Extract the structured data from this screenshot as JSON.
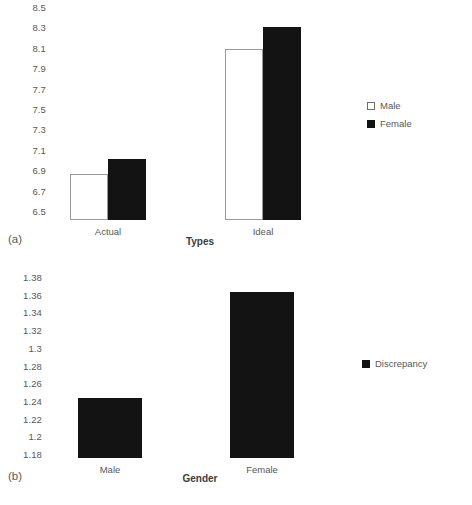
{
  "figure": {
    "background": "#ffffff",
    "text_color": "#58585a",
    "bar_fill_color": "#131313",
    "bar_open_color": "#ffffff",
    "bar_border_color": "#9a9a9c"
  },
  "panel_a": {
    "tag": "(a)",
    "xlabel": "Types",
    "legend": [
      {
        "label": "Male",
        "swatch": "open-square-icon"
      },
      {
        "label": "Female",
        "swatch": "filled-square-icon"
      }
    ],
    "yticks": [
      "8.5",
      "8.3",
      "8.1",
      "7.9",
      "7.7",
      "7.5",
      "7.3",
      "7.1",
      "6.9",
      "6.7",
      "6.5"
    ],
    "categories": [
      "Actual",
      "Ideal"
    ]
  },
  "panel_b": {
    "tag": "(b)",
    "xlabel": "Gender",
    "legend": [
      {
        "label": "Discrepancy",
        "swatch": "filled-square-icon"
      }
    ],
    "yticks": [
      "1.38",
      "1.36",
      "1.34",
      "1.32",
      "1.3",
      "1.28",
      "1.26",
      "1.24",
      "1.22",
      "1.2",
      "1.18"
    ],
    "categories": [
      "Male",
      "Female"
    ]
  },
  "chart_data": [
    {
      "type": "bar",
      "panel": "(a)",
      "title": "",
      "xlabel": "Types",
      "ylabel": "",
      "ylim": [
        6.5,
        8.5
      ],
      "ytick_step": 0.2,
      "grid": false,
      "legend_position": "right",
      "categories": [
        "Actual",
        "Ideal"
      ],
      "series": [
        {
          "name": "Male",
          "color": "#ffffff",
          "values": [
            6.93,
            8.11
          ]
        },
        {
          "name": "Female",
          "color": "#131313",
          "values": [
            7.08,
            8.32
          ]
        }
      ]
    },
    {
      "type": "bar",
      "panel": "(b)",
      "title": "",
      "xlabel": "Gender",
      "ylabel": "",
      "ylim": [
        1.18,
        1.38
      ],
      "ytick_step": 0.02,
      "grid": false,
      "legend_position": "right",
      "categories": [
        "Male",
        "Female"
      ],
      "series": [
        {
          "name": "Discrepancy",
          "color": "#131313",
          "values": [
            1.247,
            1.365
          ]
        }
      ]
    }
  ]
}
